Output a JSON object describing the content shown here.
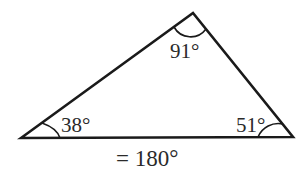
{
  "diagram": {
    "type": "triangle-angle-sum",
    "angles": [
      {
        "vertex": "top",
        "label": "91°",
        "value": 91
      },
      {
        "vertex": "bottom-left",
        "label": "38°",
        "value": 38
      },
      {
        "vertex": "bottom-right",
        "label": "51°",
        "value": 51
      }
    ],
    "sum_label": "= 180°",
    "colors": {
      "stroke": "#1a1a1a",
      "text": "#2a2a2a",
      "background": "#ffffff"
    }
  }
}
